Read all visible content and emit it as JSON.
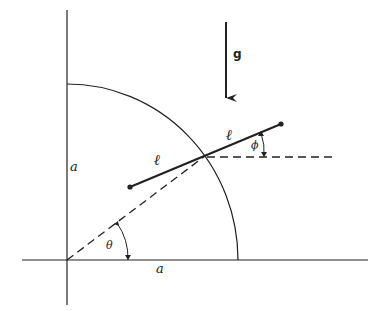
{
  "diagram": {
    "type": "physics-mechanics",
    "labels": {
      "gravity": "g",
      "rod_half_left": "ℓ",
      "rod_half_right": "ℓ",
      "radius_vertical": "a",
      "radius_horizontal": "a",
      "angle_theta": "θ",
      "angle_phi": "ϕ"
    },
    "colors": {
      "line": "#222222",
      "background": "#ffffff"
    }
  }
}
